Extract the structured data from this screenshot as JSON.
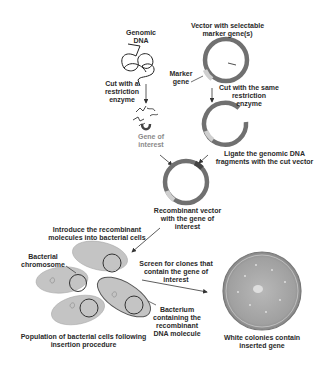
{
  "diagram": {
    "labels": {
      "genomic_dna": "Genomic\nDNA",
      "vector": "Vector with selectable\nmarker gene(s)",
      "marker_gene": "Marker\ngene",
      "cut_restriction": "Cut with a\nrestriction\nenzyme",
      "cut_same": "Cut with the same\nrestriction\nenzyme",
      "gene_of_interest": "Gene of\ninterest",
      "ligate": "Ligate the genomic DNA\nfragments with the cut vector",
      "recombinant_vector": "Recombinant vector\nwith the gene of\ninterest",
      "introduce": "Introduce the recombinant\nmolecules into bacterial cells",
      "bacterial_chromosome": "Bacterial\nchromosome",
      "screen": "Screen for clones that\ncontain the gene of\ninterest",
      "bacterium_containing": "Bacterium\ncontaining the\nrecombinant\nDNA molecule",
      "population": "Population of bacterial cells following\ninsertion procedure",
      "white_colonies": "White colonies contain\ninserted gene"
    },
    "colors": {
      "plasmid": "#707070",
      "marker": "#c8c8c8",
      "insert": "#555555",
      "bacterium_fill": "#c4c4c4",
      "dish": "#9a9a9a",
      "text": "#2a2a2a"
    }
  }
}
